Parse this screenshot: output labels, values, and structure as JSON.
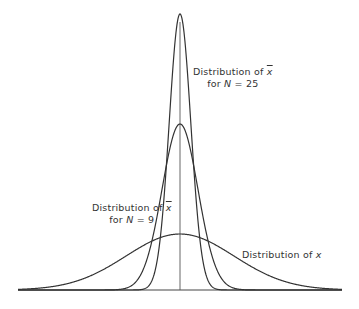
{
  "chart_data": {
    "type": "line",
    "title": "",
    "xlabel": "",
    "ylabel": "",
    "grid": false,
    "legend_position": "inline annotations",
    "mean_marker": "vertical line at mean",
    "series": [
      {
        "name": "Distribution of x",
        "kind": "normal",
        "mean": 0,
        "sd": 1.0,
        "peak_px_y": 234
      },
      {
        "name": "Distribution of x̄ for N = 9",
        "kind": "normal",
        "mean": 0,
        "sd": 0.333,
        "peak_px_y": 124
      },
      {
        "name": "Distribution of x̄ for N = 25",
        "kind": "normal",
        "mean": 0,
        "sd": 0.2,
        "peak_px_y": 14
      }
    ],
    "annotations": [
      {
        "text_line1": "Distribution of x̄",
        "text_line2": "for N = 25"
      },
      {
        "text_line1": "Distribution of x̄",
        "text_line2": "for N = 9"
      },
      {
        "text_line1": "Distribution of x"
      }
    ]
  },
  "labels": {
    "n25_line1_prefix": "Distribution of ",
    "n25_line1_var": "x",
    "n25_line2_prefix": "for ",
    "n25_line2_var": "N",
    "n25_line2_suffix": " = 25",
    "n9_line1_prefix": "Distribution of ",
    "n9_line1_var": "x",
    "n9_line2_prefix": "for ",
    "n9_line2_var": "N",
    "n9_line2_suffix": " = 9",
    "x_prefix": "Distribution of ",
    "x_var": "x"
  }
}
